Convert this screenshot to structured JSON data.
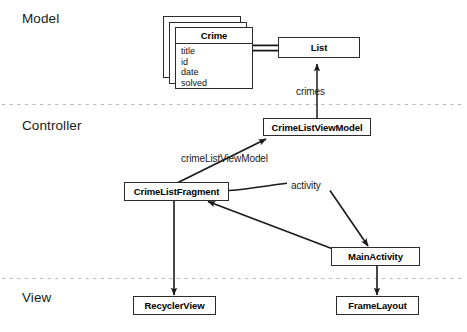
{
  "diagram": {
    "title_layers": [
      {
        "id": "model",
        "label": "Model"
      },
      {
        "id": "controller",
        "label": "Controller"
      },
      {
        "id": "view",
        "label": "View"
      }
    ],
    "model": {
      "crime_class": {
        "name": "Crime",
        "fields": [
          "title",
          "id",
          "date",
          "solved"
        ],
        "stacked_copies": 3
      },
      "list_box": {
        "label": "List"
      },
      "edge_crimes_label": "crimes"
    },
    "controller": {
      "viewmodel_box": {
        "label": "CrimeListViewModel"
      },
      "fragment_box": {
        "label": "CrimeListFragment"
      },
      "activity_box": {
        "label": "MainActivity"
      },
      "edge_viewmodel_label": "crimeListViewModel",
      "edge_activity_label": "activity"
    },
    "view": {
      "recycler_box": {
        "label": "RecyclerView"
      },
      "frame_box": {
        "label": "FrameLayout"
      }
    },
    "colors": {
      "stroke": "#2b2b2b",
      "background": "#ffffff",
      "divider": "#b9b9b9",
      "text": "#111111"
    }
  }
}
